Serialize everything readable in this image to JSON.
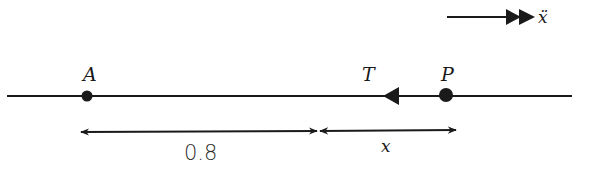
{
  "diagram": {
    "title": "",
    "colors": {
      "ink": "#1a1a1a",
      "background": "#ffffff"
    },
    "acceleration_indicator": {
      "label": "ẍ",
      "direction": "right",
      "arrow_style": "double-head"
    },
    "line": {
      "points": [
        {
          "id": "A",
          "label": "A",
          "type": "dot"
        },
        {
          "id": "P",
          "label": "P",
          "type": "dot"
        }
      ],
      "forces": [
        {
          "id": "T",
          "label": "T",
          "direction": "left",
          "applied_at": "P"
        }
      ]
    },
    "dimensions": [
      {
        "from": "A",
        "to": "equilibrium",
        "label": "0.8"
      },
      {
        "from": "equilibrium",
        "to": "P",
        "label": "x"
      }
    ]
  }
}
